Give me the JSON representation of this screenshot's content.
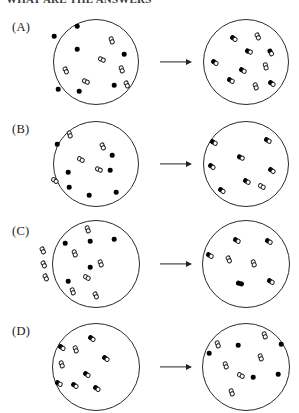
{
  "header": {
    "clipped_text": "WHAT ARE THE ANSWERS"
  },
  "figure": {
    "type": "multiple-choice-reaction-diagram",
    "colors": {
      "ink": "#222222",
      "vessel_outline": "#2b2b2b",
      "filled_atom": "#000000",
      "open_atom": "#ffffff",
      "background": "#ffffff"
    },
    "legend": {
      "filled_circle": "filled atom",
      "open_dumbbell": "diatomic molecule of two open atoms",
      "mixed_dumbbell": "diatomic molecule of one filled and one open atom"
    },
    "arrow_label": "reacts to form",
    "panels": [
      {
        "label": "(A)",
        "label_x": 12,
        "label_y": 20,
        "arrow": {
          "x": 160,
          "y": 62,
          "width": 32
        },
        "before": {
          "cx": 96,
          "cy": 62,
          "r": 43,
          "atoms": [
            {
              "x": 77,
              "y": 26
            },
            {
              "x": 54,
              "y": 36
            },
            {
              "x": 77,
              "y": 49
            },
            {
              "x": 124,
              "y": 54
            },
            {
              "x": 114,
              "y": 85
            },
            {
              "x": 79,
              "y": 91
            },
            {
              "x": 58,
              "y": 89
            }
          ],
          "molecules": [
            {
              "x": 112,
              "y": 40,
              "rot": 70,
              "fill": "none"
            },
            {
              "x": 102,
              "y": 59,
              "rot": 25,
              "fill": "none"
            },
            {
              "x": 122,
              "y": 69,
              "rot": 70,
              "fill": "none"
            },
            {
              "x": 127,
              "y": 84,
              "rot": 65,
              "fill": "none"
            },
            {
              "x": 66,
              "y": 70,
              "rot": 65,
              "fill": "none"
            },
            {
              "x": 86,
              "y": 81,
              "rot": 25,
              "fill": "none"
            }
          ]
        },
        "after": {
          "cx": 246,
          "cy": 62,
          "r": 43,
          "atoms": [],
          "molecules": [
            {
              "x": 234,
              "y": 38,
              "rot": 35,
              "fill": "left"
            },
            {
              "x": 258,
              "y": 36,
              "rot": 65,
              "fill": "none"
            },
            {
              "x": 249,
              "y": 51,
              "rot": 20,
              "fill": "left"
            },
            {
              "x": 271,
              "y": 52,
              "rot": 60,
              "fill": "left"
            },
            {
              "x": 215,
              "y": 62,
              "rot": 35,
              "fill": "left"
            },
            {
              "x": 266,
              "y": 66,
              "rot": 75,
              "fill": "none"
            },
            {
              "x": 243,
              "y": 70,
              "rot": 30,
              "fill": "left"
            },
            {
              "x": 231,
              "y": 80,
              "rot": 30,
              "fill": "left"
            },
            {
              "x": 256,
              "y": 86,
              "rot": 70,
              "fill": "none"
            },
            {
              "x": 272,
              "y": 83,
              "rot": 35,
              "fill": "left"
            }
          ]
        }
      },
      {
        "label": "(B)",
        "label_x": 12,
        "label_y": 122,
        "arrow": {
          "x": 160,
          "y": 164,
          "width": 32
        },
        "before": {
          "cx": 96,
          "cy": 164,
          "r": 43,
          "atoms": [
            {
              "x": 57,
              "y": 144
            },
            {
              "x": 68,
              "y": 172
            },
            {
              "x": 110,
              "y": 170
            },
            {
              "x": 112,
              "y": 155
            },
            {
              "x": 69,
              "y": 187
            },
            {
              "x": 89,
              "y": 195
            },
            {
              "x": 116,
              "y": 192
            }
          ],
          "molecules": [
            {
              "x": 70,
              "y": 134,
              "rot": 70,
              "fill": "none"
            },
            {
              "x": 103,
              "y": 146,
              "rot": 65,
              "fill": "none"
            },
            {
              "x": 81,
              "y": 159,
              "rot": 30,
              "fill": "none"
            },
            {
              "x": 99,
              "y": 169,
              "rot": 25,
              "fill": "none"
            },
            {
              "x": 55,
              "y": 180,
              "rot": 35,
              "fill": "none"
            }
          ]
        },
        "after": {
          "cx": 246,
          "cy": 164,
          "r": 43,
          "atoms": [],
          "molecules": [
            {
              "x": 214,
              "y": 142,
              "rot": 30,
              "fill": "left"
            },
            {
              "x": 268,
              "y": 140,
              "rot": 30,
              "fill": "left"
            },
            {
              "x": 241,
              "y": 157,
              "rot": 25,
              "fill": "left"
            },
            {
              "x": 212,
              "y": 166,
              "rot": 35,
              "fill": "left"
            },
            {
              "x": 272,
              "y": 170,
              "rot": 35,
              "fill": "left"
            },
            {
              "x": 247,
              "y": 181,
              "rot": 30,
              "fill": "left"
            },
            {
              "x": 222,
              "y": 190,
              "rot": 35,
              "fill": "left"
            },
            {
              "x": 262,
              "y": 186,
              "rot": 30,
              "fill": "none"
            }
          ]
        }
      },
      {
        "label": "(C)",
        "label_x": 12,
        "label_y": 224,
        "arrow": {
          "x": 160,
          "y": 264,
          "width": 32
        },
        "before": {
          "cx": 96,
          "cy": 264,
          "r": 44,
          "atoms": [
            {
              "x": 65,
              "y": 243
            },
            {
              "x": 90,
              "y": 241
            },
            {
              "x": 114,
              "y": 239
            },
            {
              "x": 90,
              "y": 267
            },
            {
              "x": 68,
              "y": 281
            }
          ],
          "molecules": [
            {
              "x": 88,
              "y": 229,
              "rot": 70,
              "fill": "none"
            },
            {
              "x": 43,
              "y": 250,
              "rot": 65,
              "fill": "none"
            },
            {
              "x": 44,
              "y": 264,
              "rot": 65,
              "fill": "none"
            },
            {
              "x": 46,
              "y": 277,
              "rot": 65,
              "fill": "none"
            },
            {
              "x": 75,
              "y": 253,
              "rot": 70,
              "fill": "none"
            },
            {
              "x": 101,
              "y": 263,
              "rot": 70,
              "fill": "none"
            },
            {
              "x": 87,
              "y": 277,
              "rot": 30,
              "fill": "none"
            },
            {
              "x": 73,
              "y": 291,
              "rot": 70,
              "fill": "none"
            },
            {
              "x": 96,
              "y": 295,
              "rot": 65,
              "fill": "none"
            }
          ]
        },
        "after": {
          "cx": 246,
          "cy": 264,
          "r": 44,
          "atoms": [],
          "molecules": [
            {
              "x": 237,
              "y": 240,
              "rot": 30,
              "fill": "left"
            },
            {
              "x": 269,
              "y": 241,
              "rot": 30,
              "fill": "left"
            },
            {
              "x": 210,
              "y": 255,
              "rot": 30,
              "fill": "left"
            },
            {
              "x": 229,
              "y": 259,
              "rot": 65,
              "fill": "none"
            },
            {
              "x": 254,
              "y": 263,
              "rot": 70,
              "fill": "none"
            },
            {
              "x": 271,
              "y": 281,
              "rot": 30,
              "fill": "left"
            },
            {
              "x": 240,
              "y": 283,
              "rot": 15,
              "fill": "both"
            }
          ]
        }
      },
      {
        "label": "(D)",
        "label_x": 12,
        "label_y": 324,
        "arrow": {
          "x": 160,
          "y": 367,
          "width": 32
        },
        "before": {
          "cx": 96,
          "cy": 367,
          "r": 44,
          "atoms": [],
          "molecules": [
            {
              "x": 92,
              "y": 338,
              "rot": 35,
              "fill": "left"
            },
            {
              "x": 62,
              "y": 347,
              "rot": 35,
              "fill": "left"
            },
            {
              "x": 76,
              "y": 349,
              "rot": 70,
              "fill": "none"
            },
            {
              "x": 106,
              "y": 358,
              "rot": 35,
              "fill": "left"
            },
            {
              "x": 62,
              "y": 364,
              "rot": 70,
              "fill": "none"
            },
            {
              "x": 87,
              "y": 374,
              "rot": 35,
              "fill": "left"
            },
            {
              "x": 75,
              "y": 385,
              "rot": 35,
              "fill": "left"
            },
            {
              "x": 59,
              "y": 383,
              "rot": 30,
              "fill": "left"
            },
            {
              "x": 97,
              "y": 388,
              "rot": 35,
              "fill": "left"
            }
          ]
        },
        "after": {
          "cx": 246,
          "cy": 367,
          "r": 44,
          "atoms": [
            {
              "x": 238,
              "y": 345
            },
            {
              "x": 281,
              "y": 344
            },
            {
              "x": 209,
              "y": 353
            },
            {
              "x": 253,
              "y": 377
            },
            {
              "x": 278,
              "y": 374
            }
          ],
          "molecules": [
            {
              "x": 265,
              "y": 335,
              "rot": 70,
              "fill": "none"
            },
            {
              "x": 218,
              "y": 344,
              "rot": 70,
              "fill": "none"
            },
            {
              "x": 261,
              "y": 357,
              "rot": 70,
              "fill": "none"
            },
            {
              "x": 226,
              "y": 365,
              "rot": 70,
              "fill": "none"
            },
            {
              "x": 241,
              "y": 375,
              "rot": 30,
              "fill": "none"
            },
            {
              "x": 232,
              "y": 392,
              "rot": 70,
              "fill": "none"
            }
          ]
        }
      }
    ]
  }
}
